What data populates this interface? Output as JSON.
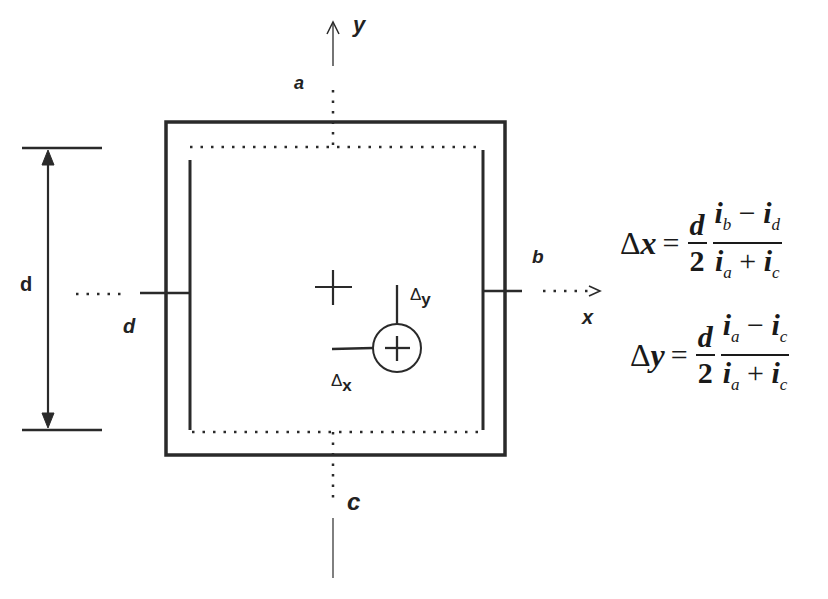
{
  "diagram": {
    "type": "quadrant-detector-position-sensing",
    "axes": {
      "y_label": "y",
      "x_label": "x"
    },
    "electrodes": {
      "top": "a",
      "right": "b",
      "bottom": "c",
      "left": "d"
    },
    "dimension": {
      "label": "d"
    },
    "displacements": {
      "dx_label": "Δ",
      "dx_sub": "x",
      "dy_label": "Δ",
      "dy_sub": "y"
    },
    "colors": {
      "line": "#2a2a2a",
      "background": "#ffffff"
    }
  },
  "equations": {
    "dx": {
      "lhs_delta": "Δ",
      "lhs_var": "x",
      "equals": "=",
      "frac1_num": "d",
      "frac1_den": "2",
      "frac2_num_i1": "i",
      "frac2_num_s1": "b",
      "frac2_num_op": " − ",
      "frac2_num_i2": "i",
      "frac2_num_s2": "d",
      "frac2_den_i1": "i",
      "frac2_den_s1": "a",
      "frac2_den_op": " + ",
      "frac2_den_i2": "i",
      "frac2_den_s2": "c"
    },
    "dy": {
      "lhs_delta": "Δ",
      "lhs_var": "y",
      "equals": "=",
      "frac1_num": "d",
      "frac1_den": "2",
      "frac2_num_i1": "i",
      "frac2_num_s1": "a",
      "frac2_num_op": " − ",
      "frac2_num_i2": "i",
      "frac2_num_s2": "c",
      "frac2_den_i1": "i",
      "frac2_den_s1": "a",
      "frac2_den_op": " + ",
      "frac2_den_i2": "i",
      "frac2_den_s2": "c"
    }
  }
}
